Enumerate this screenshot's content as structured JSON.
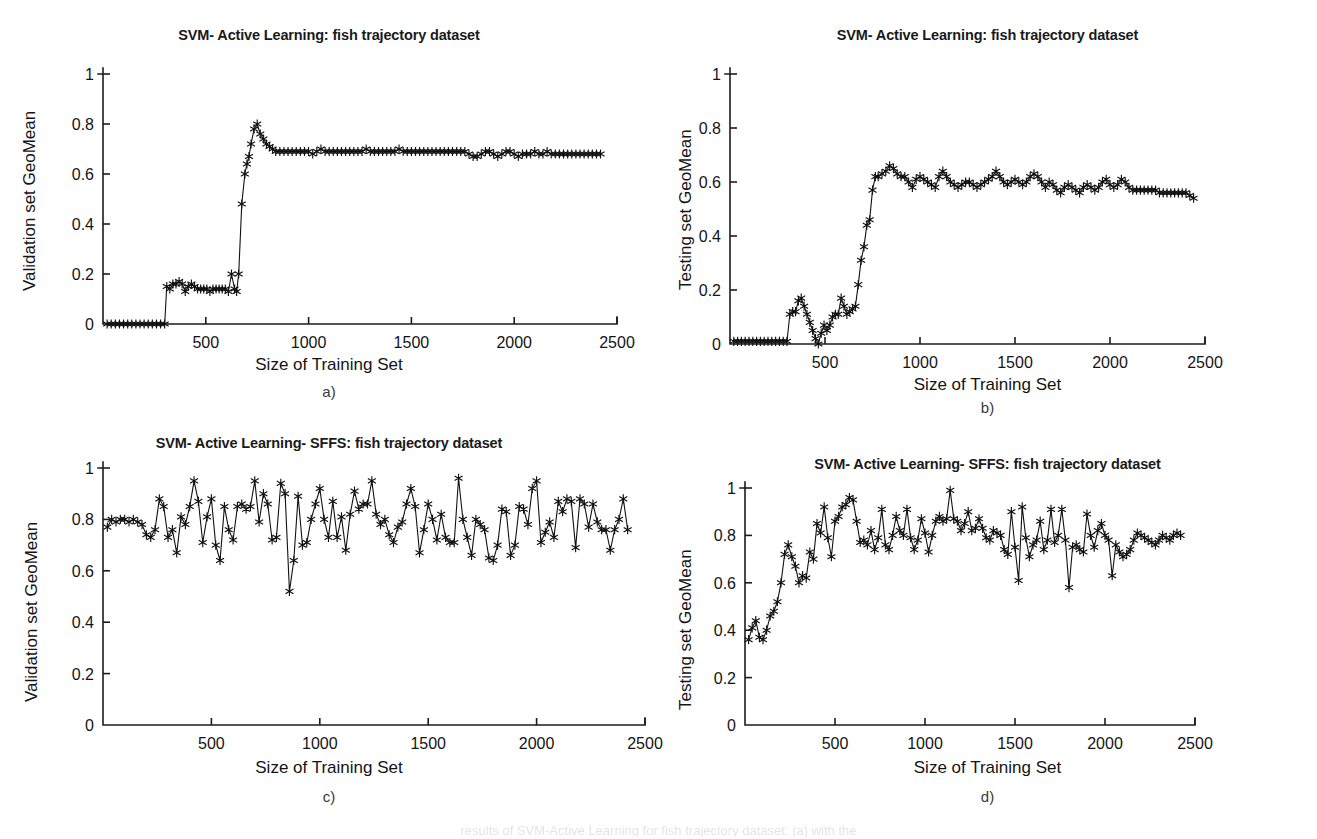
{
  "figure": {
    "background": "#ffffff",
    "ink_color": "#111111",
    "caption_fragment": "results of SVM-Active Learning for fish trajectory dataset: (a) with the"
  },
  "panels": [
    {
      "key": "a",
      "panel_label": "a)",
      "title": "SVM- Active Learning: fish trajectory dataset",
      "chart_data": {
        "type": "line",
        "title": "SVM- Active Learning: fish trajectory dataset",
        "xlabel": "Size of Training Set",
        "ylabel": "Validation set GeoMean",
        "xlim": [
          0,
          2500
        ],
        "ylim": [
          0,
          1
        ],
        "xticks": [
          500,
          1000,
          1500,
          2000,
          2500
        ],
        "yticks": [
          0,
          0.2,
          0.4,
          0.6,
          0.8,
          1
        ],
        "grid": false,
        "legend": "none",
        "marker": "asterisk",
        "x": [
          20,
          40,
          60,
          80,
          100,
          120,
          140,
          160,
          180,
          200,
          220,
          240,
          260,
          280,
          300,
          310,
          325,
          340,
          355,
          370,
          385,
          400,
          415,
          430,
          445,
          460,
          475,
          490,
          505,
          520,
          535,
          550,
          565,
          580,
          595,
          610,
          625,
          640,
          650,
          660,
          675,
          690,
          700,
          710,
          720,
          735,
          750,
          765,
          780,
          795,
          810,
          825,
          840,
          860,
          880,
          900,
          920,
          940,
          960,
          980,
          1000,
          1020,
          1040,
          1060,
          1080,
          1100,
          1120,
          1140,
          1160,
          1180,
          1200,
          1220,
          1240,
          1260,
          1280,
          1300,
          1320,
          1340,
          1360,
          1380,
          1400,
          1420,
          1440,
          1460,
          1480,
          1500,
          1520,
          1540,
          1560,
          1580,
          1600,
          1620,
          1640,
          1660,
          1680,
          1700,
          1720,
          1740,
          1760,
          1780,
          1800,
          1820,
          1840,
          1860,
          1880,
          1900,
          1920,
          1940,
          1960,
          1980,
          2000,
          2020,
          2040,
          2060,
          2080,
          2100,
          2120,
          2140,
          2160,
          2180,
          2200,
          2220,
          2240,
          2260,
          2280,
          2300,
          2320,
          2340,
          2360,
          2380,
          2400,
          2420,
          2440
        ],
        "y": [
          0,
          0,
          0,
          0,
          0,
          0,
          0,
          0,
          0,
          0,
          0,
          0,
          0,
          0,
          0,
          0.15,
          0.14,
          0.16,
          0.16,
          0.17,
          0.16,
          0.13,
          0.15,
          0.16,
          0.15,
          0.14,
          0.14,
          0.14,
          0.14,
          0.13,
          0.14,
          0.14,
          0.14,
          0.14,
          0.14,
          0.13,
          0.2,
          0.14,
          0.13,
          0.2,
          0.48,
          0.6,
          0.64,
          0.67,
          0.72,
          0.78,
          0.8,
          0.76,
          0.74,
          0.72,
          0.71,
          0.7,
          0.69,
          0.69,
          0.69,
          0.69,
          0.69,
          0.69,
          0.69,
          0.69,
          0.69,
          0.68,
          0.69,
          0.7,
          0.69,
          0.69,
          0.69,
          0.69,
          0.69,
          0.69,
          0.69,
          0.69,
          0.69,
          0.69,
          0.7,
          0.69,
          0.69,
          0.69,
          0.69,
          0.69,
          0.69,
          0.69,
          0.7,
          0.69,
          0.69,
          0.69,
          0.69,
          0.69,
          0.69,
          0.69,
          0.69,
          0.69,
          0.69,
          0.69,
          0.69,
          0.69,
          0.69,
          0.69,
          0.69,
          0.68,
          0.67,
          0.67,
          0.68,
          0.69,
          0.69,
          0.68,
          0.67,
          0.68,
          0.69,
          0.69,
          0.68,
          0.67,
          0.68,
          0.68,
          0.68,
          0.69,
          0.68,
          0.68,
          0.69,
          0.68,
          0.68,
          0.68,
          0.68,
          0.68,
          0.68,
          0.68,
          0.68,
          0.68,
          0.68,
          0.68,
          0.68,
          0.68
        ]
      }
    },
    {
      "key": "b",
      "panel_label": "b)",
      "title": "SVM- Active Learning: fish trajectory dataset",
      "chart_data": {
        "type": "line",
        "title": "SVM- Active Learning: fish trajectory dataset",
        "xlabel": "Size of Training Set",
        "ylabel": "Testing set GeoMean",
        "xlim": [
          0,
          2500
        ],
        "ylim": [
          0,
          1
        ],
        "xticks": [
          500,
          1000,
          1500,
          2000,
          2500
        ],
        "yticks": [
          0,
          0.2,
          0.4,
          0.6,
          0.8,
          1
        ],
        "grid": false,
        "legend": "none",
        "marker": "asterisk",
        "x": [
          20,
          40,
          60,
          80,
          100,
          120,
          140,
          160,
          180,
          200,
          220,
          240,
          260,
          280,
          300,
          315,
          330,
          345,
          360,
          375,
          390,
          405,
          420,
          435,
          450,
          465,
          480,
          495,
          510,
          525,
          540,
          555,
          570,
          585,
          600,
          615,
          630,
          645,
          660,
          675,
          690,
          705,
          720,
          735,
          750,
          765,
          780,
          800,
          820,
          840,
          860,
          880,
          900,
          920,
          940,
          960,
          980,
          1000,
          1020,
          1040,
          1060,
          1080,
          1100,
          1120,
          1140,
          1160,
          1180,
          1200,
          1220,
          1240,
          1260,
          1280,
          1300,
          1320,
          1340,
          1360,
          1380,
          1400,
          1420,
          1440,
          1460,
          1480,
          1500,
          1520,
          1540,
          1560,
          1580,
          1600,
          1620,
          1640,
          1660,
          1680,
          1700,
          1720,
          1740,
          1760,
          1780,
          1800,
          1820,
          1840,
          1860,
          1880,
          1900,
          1920,
          1940,
          1960,
          1980,
          2000,
          2020,
          2040,
          2060,
          2080,
          2100,
          2120,
          2140,
          2160,
          2180,
          2200,
          2220,
          2240,
          2260,
          2280,
          2300,
          2320,
          2340,
          2360,
          2380,
          2400,
          2420,
          2440
        ],
        "y": [
          0.01,
          0.01,
          0.01,
          0.01,
          0.01,
          0.01,
          0.01,
          0.01,
          0.01,
          0.01,
          0.01,
          0.01,
          0.01,
          0.01,
          0.01,
          0.11,
          0.12,
          0.12,
          0.16,
          0.17,
          0.14,
          0.11,
          0.08,
          0.05,
          0.02,
          0.0,
          0.04,
          0.07,
          0.05,
          0.07,
          0.1,
          0.11,
          0.11,
          0.17,
          0.14,
          0.11,
          0.12,
          0.13,
          0.14,
          0.22,
          0.31,
          0.36,
          0.44,
          0.46,
          0.57,
          0.62,
          0.62,
          0.63,
          0.64,
          0.66,
          0.65,
          0.63,
          0.62,
          0.62,
          0.6,
          0.58,
          0.61,
          0.62,
          0.61,
          0.6,
          0.59,
          0.58,
          0.62,
          0.64,
          0.62,
          0.6,
          0.59,
          0.58,
          0.59,
          0.6,
          0.6,
          0.59,
          0.58,
          0.59,
          0.6,
          0.61,
          0.62,
          0.64,
          0.62,
          0.6,
          0.59,
          0.6,
          0.61,
          0.6,
          0.59,
          0.6,
          0.62,
          0.63,
          0.62,
          0.6,
          0.58,
          0.6,
          0.59,
          0.57,
          0.56,
          0.58,
          0.59,
          0.58,
          0.57,
          0.56,
          0.58,
          0.59,
          0.58,
          0.57,
          0.58,
          0.6,
          0.61,
          0.59,
          0.58,
          0.59,
          0.61,
          0.6,
          0.58,
          0.57,
          0.57,
          0.57,
          0.57,
          0.57,
          0.57,
          0.57,
          0.56,
          0.56,
          0.56,
          0.56,
          0.56,
          0.56,
          0.56,
          0.56,
          0.55,
          0.54,
          0.53
        ]
      }
    },
    {
      "key": "c",
      "panel_label": "c)",
      "title": "SVM- Active Learning- SFFS: fish trajectory dataset",
      "chart_data": {
        "type": "line",
        "title": "SVM- Active Learning- SFFS: fish trajectory dataset",
        "xlabel": "Size of Training Set",
        "ylabel": "Validation set GeoMean",
        "xlim": [
          0,
          2500
        ],
        "ylim": [
          0,
          1
        ],
        "xticks": [
          500,
          1000,
          1500,
          2000,
          2500
        ],
        "yticks": [
          0,
          0.2,
          0.4,
          0.6,
          0.8,
          1
        ],
        "grid": false,
        "legend": "none",
        "marker": "asterisk",
        "x": [
          20,
          40,
          60,
          80,
          100,
          120,
          140,
          160,
          180,
          200,
          220,
          240,
          260,
          280,
          300,
          320,
          340,
          360,
          380,
          400,
          420,
          440,
          460,
          480,
          500,
          520,
          540,
          560,
          580,
          600,
          620,
          640,
          660,
          680,
          700,
          720,
          740,
          760,
          780,
          800,
          820,
          840,
          860,
          880,
          900,
          920,
          940,
          960,
          980,
          1000,
          1020,
          1040,
          1060,
          1080,
          1100,
          1120,
          1140,
          1160,
          1180,
          1200,
          1220,
          1240,
          1260,
          1280,
          1300,
          1320,
          1340,
          1360,
          1380,
          1400,
          1420,
          1440,
          1460,
          1480,
          1500,
          1520,
          1540,
          1560,
          1580,
          1600,
          1620,
          1640,
          1660,
          1680,
          1700,
          1720,
          1740,
          1760,
          1780,
          1800,
          1820,
          1840,
          1860,
          1880,
          1900,
          1920,
          1940,
          1960,
          1980,
          2000,
          2020,
          2040,
          2060,
          2080,
          2100,
          2120,
          2140,
          2160,
          2180,
          2200,
          2220,
          2240,
          2260,
          2280,
          2300,
          2320,
          2340,
          2360,
          2380,
          2400,
          2420,
          2440
        ],
        "y": [
          0.77,
          0.8,
          0.79,
          0.8,
          0.8,
          0.79,
          0.8,
          0.79,
          0.78,
          0.74,
          0.73,
          0.76,
          0.88,
          0.85,
          0.73,
          0.76,
          0.67,
          0.81,
          0.78,
          0.85,
          0.95,
          0.87,
          0.71,
          0.81,
          0.88,
          0.7,
          0.64,
          0.85,
          0.76,
          0.72,
          0.85,
          0.86,
          0.84,
          0.85,
          0.95,
          0.79,
          0.9,
          0.86,
          0.72,
          0.73,
          0.94,
          0.9,
          0.52,
          0.64,
          0.89,
          0.7,
          0.71,
          0.8,
          0.86,
          0.92,
          0.8,
          0.73,
          0.87,
          0.73,
          0.81,
          0.68,
          0.82,
          0.91,
          0.84,
          0.86,
          0.86,
          0.95,
          0.82,
          0.78,
          0.8,
          0.74,
          0.71,
          0.77,
          0.79,
          0.86,
          0.92,
          0.85,
          0.67,
          0.76,
          0.86,
          0.8,
          0.72,
          0.82,
          0.73,
          0.71,
          0.71,
          0.96,
          0.8,
          0.73,
          0.66,
          0.8,
          0.78,
          0.76,
          0.65,
          0.64,
          0.7,
          0.84,
          0.83,
          0.66,
          0.7,
          0.85,
          0.84,
          0.78,
          0.92,
          0.95,
          0.71,
          0.75,
          0.79,
          0.73,
          0.87,
          0.83,
          0.88,
          0.87,
          0.69,
          0.88,
          0.86,
          0.77,
          0.86,
          0.79,
          0.76,
          0.76,
          0.68,
          0.76,
          0.8,
          0.88,
          0.76
        ]
      }
    },
    {
      "key": "d",
      "panel_label": "d)",
      "title": "SVM- Active Learning- SFFS: fish trajectory dataset",
      "chart_data": {
        "type": "line",
        "title": "SVM- Active Learning- SFFS: fish trajectory dataset",
        "xlabel": "Size of Training Set",
        "ylabel": "Testing set GeoMean",
        "xlim": [
          0,
          2500
        ],
        "ylim": [
          0,
          1
        ],
        "xticks": [
          500,
          1000,
          1500,
          2000,
          2500
        ],
        "yticks": [
          0,
          0.2,
          0.4,
          0.6,
          0.8,
          1
        ],
        "grid": false,
        "legend": "none",
        "marker": "asterisk",
        "x": [
          20,
          40,
          60,
          80,
          100,
          120,
          140,
          160,
          180,
          200,
          220,
          240,
          260,
          280,
          300,
          320,
          340,
          360,
          380,
          400,
          420,
          440,
          460,
          480,
          500,
          520,
          540,
          560,
          580,
          600,
          620,
          640,
          660,
          680,
          700,
          720,
          740,
          760,
          780,
          800,
          820,
          840,
          860,
          880,
          900,
          920,
          940,
          960,
          980,
          1000,
          1020,
          1040,
          1060,
          1080,
          1100,
          1120,
          1140,
          1160,
          1180,
          1200,
          1220,
          1240,
          1260,
          1280,
          1300,
          1320,
          1340,
          1360,
          1380,
          1400,
          1420,
          1440,
          1460,
          1480,
          1500,
          1520,
          1540,
          1560,
          1580,
          1600,
          1620,
          1640,
          1660,
          1680,
          1700,
          1720,
          1740,
          1760,
          1780,
          1800,
          1820,
          1840,
          1860,
          1880,
          1900,
          1920,
          1940,
          1960,
          1980,
          2000,
          2020,
          2040,
          2060,
          2080,
          2100,
          2120,
          2140,
          2160,
          2180,
          2200,
          2220,
          2240,
          2260,
          2280,
          2300,
          2320,
          2340,
          2360,
          2380,
          2400,
          2420,
          2440
        ],
        "y": [
          0.36,
          0.41,
          0.44,
          0.37,
          0.36,
          0.4,
          0.46,
          0.48,
          0.52,
          0.6,
          0.72,
          0.76,
          0.71,
          0.67,
          0.6,
          0.63,
          0.62,
          0.73,
          0.7,
          0.85,
          0.81,
          0.92,
          0.79,
          0.71,
          0.86,
          0.88,
          0.92,
          0.93,
          0.96,
          0.95,
          0.86,
          0.77,
          0.78,
          0.76,
          0.82,
          0.74,
          0.79,
          0.91,
          0.76,
          0.74,
          0.8,
          0.88,
          0.82,
          0.8,
          0.91,
          0.79,
          0.74,
          0.78,
          0.87,
          0.81,
          0.73,
          0.8,
          0.86,
          0.88,
          0.86,
          0.87,
          0.99,
          0.87,
          0.86,
          0.82,
          0.85,
          0.9,
          0.82,
          0.83,
          0.87,
          0.83,
          0.79,
          0.78,
          0.82,
          0.81,
          0.8,
          0.74,
          0.72,
          0.9,
          0.75,
          0.61,
          0.92,
          0.79,
          0.71,
          0.76,
          0.78,
          0.86,
          0.74,
          0.78,
          0.91,
          0.77,
          0.8,
          0.91,
          0.78,
          0.58,
          0.75,
          0.76,
          0.74,
          0.73,
          0.89,
          0.8,
          0.75,
          0.82,
          0.85,
          0.8,
          0.78,
          0.63,
          0.76,
          0.73,
          0.71,
          0.72,
          0.74,
          0.78,
          0.81,
          0.8,
          0.79,
          0.78,
          0.77,
          0.76,
          0.78,
          0.8,
          0.79,
          0.78,
          0.8,
          0.81,
          0.8
        ]
      }
    }
  ]
}
